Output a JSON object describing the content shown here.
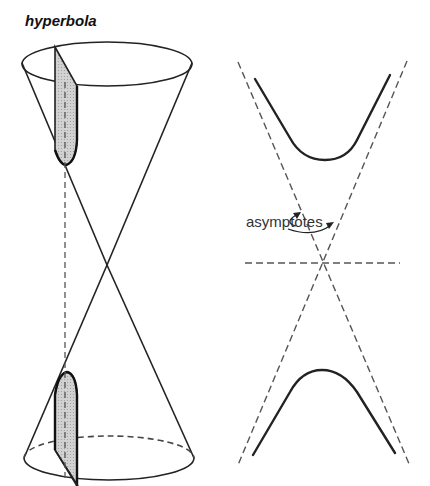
{
  "title": "hyperbola",
  "annotations": {
    "asymptotes_label": "asymptotes"
  },
  "figures": {
    "left": "double cone cut by a vertical plane producing the two branches of a hyperbola (shaded sections)",
    "right": "hyperbola with two branches and its two dashed asymptotes crossing at the center, with a dashed horizontal axis"
  },
  "colors": {
    "stroke": "#222222",
    "section_fill": "#c8c8c8",
    "dashed": "#555555",
    "background": "#ffffff"
  }
}
